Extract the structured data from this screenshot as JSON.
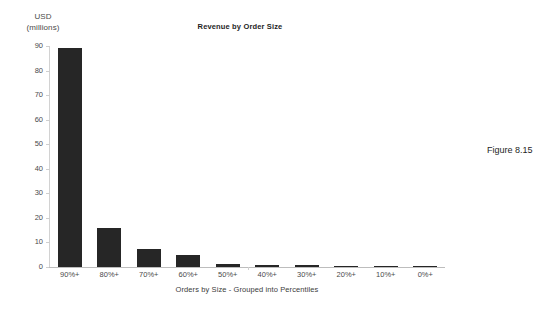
{
  "chart_data": {
    "type": "bar",
    "title": "Revenue by Order Size",
    "xlabel": "Orders by Size - Grouped into Percentiles",
    "ylabel": "USD",
    "ylabel_line1": "USD",
    "ylabel_line2": "(millions)",
    "categories": [
      "90%+",
      "80%+",
      "70%+",
      "60%+",
      "50%+",
      "40%+",
      "30%+",
      "20%+",
      "10%+",
      "0%+"
    ],
    "values": [
      89,
      16,
      7.5,
      5,
      1.2,
      1,
      0.8,
      0.5,
      0.3,
      0.15
    ],
    "ylim": [
      0,
      90
    ],
    "ytick_values": [
      0,
      10,
      20,
      30,
      40,
      50,
      60,
      70,
      80,
      90
    ],
    "ytick_labels": [
      "0",
      "10",
      "20",
      "30",
      "40",
      "50",
      "60",
      "70",
      "80",
      "90"
    ],
    "grid": false,
    "legend": "none",
    "bar_color": "#262626",
    "axis_color": "#cfcfcf",
    "text_color": "#3c3c3c"
  },
  "figure": {
    "caption": "Figure 8.15"
  }
}
